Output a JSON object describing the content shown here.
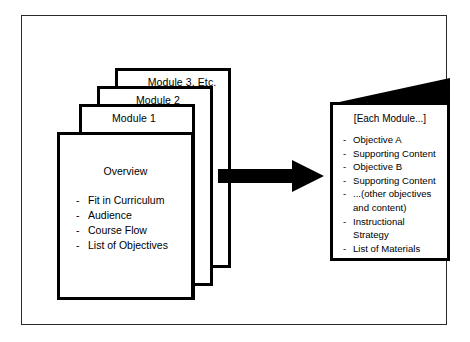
{
  "diagram": {
    "stack": {
      "cards": [
        {
          "label": "Module 3, Etc."
        },
        {
          "label": "Module 2"
        },
        {
          "label": "Module 1"
        }
      ],
      "front_card": {
        "heading": "Overview",
        "dash": "-",
        "items": [
          "Fit in Curriculum",
          "Audience",
          "Course Flow",
          "List of Objectives"
        ]
      }
    },
    "arrow": {
      "icon": "right-block-arrow",
      "color": "#000000"
    },
    "detail_card": {
      "heading": "[Each Module...]",
      "dash": "-",
      "items": [
        {
          "text": "Objective A",
          "continuation": null
        },
        {
          "text": "Supporting Content",
          "continuation": null
        },
        {
          "text": "Objective B",
          "continuation": null
        },
        {
          "text": "Supporting Content",
          "continuation": null
        },
        {
          "text": "...(other objectives",
          "continuation": "and content)"
        },
        {
          "text": "Instructional",
          "continuation": "Strategy"
        },
        {
          "text": "List of Materials",
          "continuation": null
        }
      ]
    },
    "colors": {
      "ink": "#000000",
      "frame": "#2b2b2b",
      "paper": "#ffffff"
    }
  }
}
